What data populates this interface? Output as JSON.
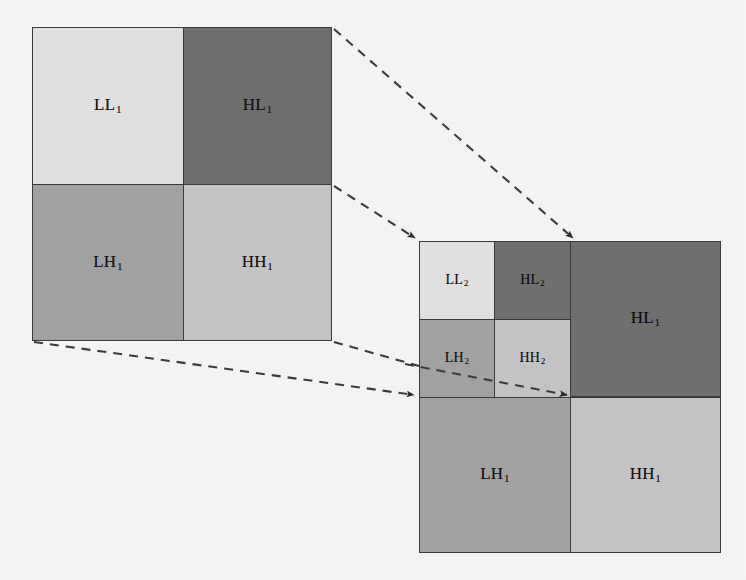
{
  "figure": {
    "background_color": "#f6f6f4",
    "border_color": "#3a3a3a",
    "colors": {
      "LL": "#e2e2e2",
      "HL": "#6f6f6f",
      "LH": "#a2a2a2",
      "HH": "#c5c5c5",
      "arrow": "#2b2b2b"
    }
  },
  "level1_figure": {
    "name": "one-level-decomposition",
    "x": 32,
    "y": 27,
    "width": 300,
    "height": 313,
    "split_x": 183,
    "split_y": 184,
    "quadrants": [
      {
        "key": "LL1",
        "base": "LL",
        "sub": "1",
        "fill": "#e2e2e2",
        "position": "top-left"
      },
      {
        "key": "HL1",
        "base": "HL",
        "sub": "1",
        "fill": "#6f6f6f",
        "position": "top-right"
      },
      {
        "key": "LH1",
        "base": "LH",
        "sub": "1",
        "fill": "#a2a2a2",
        "position": "bottom-left"
      },
      {
        "key": "HH1",
        "base": "HH",
        "sub": "1",
        "fill": "#c5c5c5",
        "position": "bottom-right"
      }
    ]
  },
  "level2_figure": {
    "name": "two-level-decomposition",
    "x": 419,
    "y": 241,
    "width": 302,
    "height": 312,
    "split_x": 570,
    "split_y": 397,
    "inner_split_x": 494,
    "inner_split_y": 319,
    "quadrants": [
      {
        "key": "HL1",
        "base": "HL",
        "sub": "1",
        "fill": "#6f6f6f",
        "position": "top-right"
      },
      {
        "key": "LH1",
        "base": "LH",
        "sub": "1",
        "fill": "#a2a2a2",
        "position": "bottom-left"
      },
      {
        "key": "HH1",
        "base": "HH",
        "sub": "1",
        "fill": "#c5c5c5",
        "position": "bottom-right"
      }
    ],
    "inner_quadrants": [
      {
        "key": "LL2",
        "base": "LL",
        "sub": "2",
        "fill": "#e2e2e2",
        "position": "top-left"
      },
      {
        "key": "HL2",
        "base": "HL",
        "sub": "2",
        "fill": "#6f6f6f",
        "position": "top-right"
      },
      {
        "key": "LH2",
        "base": "LH",
        "sub": "2",
        "fill": "#a2a2a2",
        "position": "bottom-left"
      },
      {
        "key": "HH2",
        "base": "HH",
        "sub": "2",
        "fill": "#c5c5c5",
        "position": "bottom-right"
      }
    ]
  },
  "connectors": [
    {
      "name": "hl1-top-right-to-level2-top-right",
      "from": [
        334,
        29
      ],
      "to": [
        574,
        240
      ],
      "style": "dashed",
      "arrowhead": "end"
    },
    {
      "name": "hl1-bottom-right-to-level2-top-left",
      "from": [
        334,
        186
      ],
      "to": [
        416,
        240
      ],
      "style": "dashed",
      "arrowhead": "end"
    },
    {
      "name": "lh1-bottom-left-to-level2-left-mid",
      "from": [
        34,
        342
      ],
      "to": [
        416,
        396
      ],
      "style": "dashed",
      "arrowhead": "end"
    },
    {
      "name": "hh1-bottom-right-to-level2-left-upper",
      "from": [
        334,
        342
      ],
      "to": [
        416,
        366
      ],
      "style": "dashed",
      "arrowhead": "none"
    },
    {
      "name": "inner-diagonal-to-inner-center",
      "from": [
        419,
        366
      ],
      "to": [
        568,
        396
      ],
      "style": "dashed",
      "arrowhead": "end"
    }
  ],
  "labels": {
    "LL1": "LL",
    "LL1_sub": "1",
    "HL1": "HL",
    "HL1_sub": "1",
    "LH1": "LH",
    "LH1_sub": "1",
    "HH1": "HH",
    "HH1_sub": "1",
    "LL2": "LL",
    "LL2_sub": "2",
    "HL2": "HL",
    "HL2_sub": "2",
    "LH2": "LH",
    "LH2_sub": "2",
    "HH2": "HH",
    "HH2_sub": "2",
    "HL1_right": "HL",
    "HL1_right_sub": "1",
    "LH1_right": "LH",
    "LH1_right_sub": "1",
    "HH1_right": "HH",
    "HH1_right_sub": "1"
  }
}
